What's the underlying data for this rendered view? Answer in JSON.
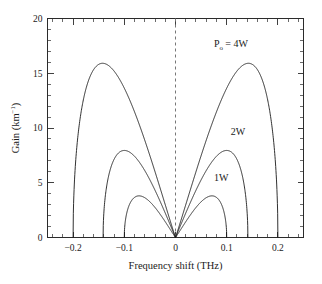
{
  "chart_data": {
    "type": "line",
    "title": "",
    "xlabel": "Frequency shift (THz)",
    "ylabel": "Gain (km−1)",
    "ylabel_base": "Gain (km",
    "ylabel_exp": "−1",
    "ylabel_tail": ")",
    "xlim": [
      -0.25,
      0.25
    ],
    "ylim": [
      0,
      20
    ],
    "grid": false,
    "legend_position": "inline-annotations",
    "xticks": [
      -0.2,
      -0.1,
      0,
      0.1,
      0.2
    ],
    "xticklabels": [
      "−0.2",
      "−0.1",
      "0",
      "0.1",
      "0.2"
    ],
    "xtick_minor_step": 0.02,
    "yticks": [
      0,
      5,
      10,
      15,
      20
    ],
    "yticklabels": [
      "0",
      "5",
      "10",
      "15",
      "20"
    ],
    "ytick_minor_step": 1,
    "reference_line": {
      "x": 0,
      "style": "dashed",
      "color": "#777777"
    },
    "series": [
      {
        "name": "P_o = 4W",
        "label": "P",
        "label_sub": "o",
        "label_tail": " = 4W",
        "peak_gain": 15.9,
        "peak_frequency": 0.14,
        "cutoff_frequency": 0.2,
        "symmetric": true,
        "label_x": 0.075,
        "label_y": 17.4
      },
      {
        "name": "2W",
        "label": "2W",
        "peak_gain": 7.95,
        "peak_frequency": 0.1,
        "cutoff_frequency": 0.1414,
        "symmetric": true,
        "label_x": 0.108,
        "label_y": 9.4
      },
      {
        "name": "1W",
        "label": "1W",
        "peak_gain": 3.8,
        "peak_frequency": 0.07,
        "cutoff_frequency": 0.1,
        "symmetric": true,
        "label_x": 0.075,
        "label_y": 5.2
      }
    ]
  }
}
